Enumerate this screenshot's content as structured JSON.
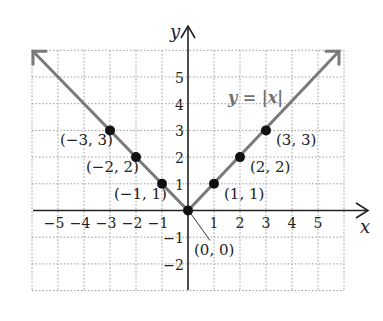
{
  "chart_data": {
    "type": "line",
    "title": "",
    "function_label": "y = |x|",
    "xlabel": "x",
    "ylabel": "y",
    "xlim": [
      -6,
      6
    ],
    "ylim": [
      -3,
      6
    ],
    "grid": true,
    "x_ticks": [
      "−5",
      "−4",
      "−3",
      "−2",
      "−1",
      "1",
      "2",
      "3",
      "4",
      "5"
    ],
    "y_ticks": [
      "5",
      "4",
      "3",
      "2",
      "1",
      "−1",
      "−2"
    ],
    "series": [
      {
        "name": "y = |x|",
        "points": [
          {
            "x": -3,
            "y": 3,
            "label": "(−3, 3)"
          },
          {
            "x": -2,
            "y": 2,
            "label": "(−2, 2)"
          },
          {
            "x": -1,
            "y": 1,
            "label": "(−1, 1)"
          },
          {
            "x": 0,
            "y": 0,
            "label": "(0, 0)"
          },
          {
            "x": 1,
            "y": 1,
            "label": "(1, 1)"
          },
          {
            "x": 2,
            "y": 2,
            "label": "(2, 2)"
          },
          {
            "x": 3,
            "y": 3,
            "label": "(3, 3)"
          }
        ]
      }
    ],
    "colors": {
      "line": "#7a7a7a",
      "points": "#111111",
      "grid": "#9a9a9a",
      "axes": "#222222"
    }
  }
}
